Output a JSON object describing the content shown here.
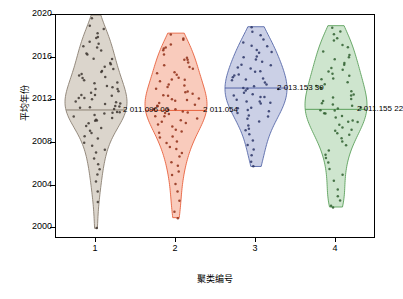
{
  "chart_data": {
    "type": "violin",
    "title": "",
    "xlabel": "聚类编号",
    "ylabel": "平均年份",
    "ylim": [
      1999,
      2020
    ],
    "xlim": [
      0.5,
      4.5
    ],
    "grid": false,
    "legend": "none",
    "y_ticks": [
      "2000",
      "2004",
      "2008",
      "2012",
      "2016",
      "2020"
    ],
    "y_tick_values": [
      2000,
      2004,
      2008,
      2012,
      2016,
      2020
    ],
    "x_ticks": [
      "1",
      "2",
      "3",
      "4"
    ],
    "x_tick_values": [
      1,
      2,
      3,
      4
    ],
    "categories": [
      "1",
      "2",
      "3",
      "4"
    ],
    "series": [
      {
        "name": "聚类1",
        "category": "1",
        "color": "#8a7f72",
        "fill": "#cfc7bb",
        "mean": 2011.09606,
        "mean_label": "2 011.096 06",
        "median": 2011.1,
        "min": 2000.0,
        "max": 2020.0,
        "n": 78,
        "points": [
          2019.6,
          2019.1,
          2018.6,
          2018.3,
          2018.0,
          2017.8,
          2017.5,
          2017.3,
          2017.0,
          2016.9,
          2016.6,
          2016.4,
          2016.2,
          2016.0,
          2015.8,
          2015.6,
          2015.4,
          2015.2,
          2015.0,
          2014.8,
          2014.6,
          2014.5,
          2014.3,
          2014.1,
          2014.0,
          2013.9,
          2013.7,
          2013.6,
          2013.4,
          2013.3,
          2013.1,
          2013.0,
          2012.9,
          2012.8,
          2012.6,
          2012.5,
          2012.4,
          2012.3,
          2012.2,
          2012.0,
          2011.9,
          2011.8,
          2011.7,
          2011.6,
          2011.5,
          2011.4,
          2011.3,
          2011.2,
          2011.1,
          2011.0,
          2010.9,
          2010.8,
          2010.7,
          2010.6,
          2010.5,
          2010.4,
          2010.2,
          2010.1,
          2010.0,
          2009.8,
          2009.6,
          2009.4,
          2009.2,
          2009.0,
          2008.7,
          2008.4,
          2008.1,
          2007.8,
          2007.4,
          2007.0,
          2006.6,
          2006.1,
          2005.6,
          2005.0,
          2004.3,
          2003.5,
          2002.4,
          2000.1
        ]
      },
      {
        "name": "聚类2",
        "category": "2",
        "color": "#e8603c",
        "fill": "#f7b9a6",
        "mean": 2011.054,
        "mean_label": "2 011.054",
        "median": 2011.05,
        "min": 2001.0,
        "max": 2018.3,
        "n": 74,
        "points": [
          2018.2,
          2017.9,
          2017.6,
          2017.3,
          2017.0,
          2016.8,
          2016.6,
          2016.3,
          2016.1,
          2015.9,
          2015.7,
          2015.5,
          2015.3,
          2015.1,
          2014.9,
          2014.7,
          2014.6,
          2014.4,
          2014.2,
          2014.0,
          2013.9,
          2013.7,
          2013.5,
          2013.4,
          2013.2,
          2013.1,
          2012.9,
          2012.8,
          2012.6,
          2012.5,
          2012.4,
          2012.2,
          2012.1,
          2012.0,
          2011.9,
          2011.8,
          2011.6,
          2011.5,
          2011.4,
          2011.3,
          2011.2,
          2011.1,
          2011.0,
          2010.9,
          2010.8,
          2010.7,
          2010.5,
          2010.4,
          2010.3,
          2010.1,
          2010.0,
          2009.8,
          2009.7,
          2009.5,
          2009.3,
          2009.1,
          2008.9,
          2008.7,
          2008.5,
          2008.2,
          2008.0,
          2007.7,
          2007.4,
          2007.1,
          2006.7,
          2006.3,
          2005.9,
          2005.4,
          2004.9,
          2004.2,
          2003.4,
          2002.6,
          2001.6,
          2001.0
        ]
      },
      {
        "name": "聚类3",
        "category": "3",
        "color": "#5566a8",
        "fill": "#b9c0de",
        "mean": 2013.15339,
        "mean_label": "2 013.153 39",
        "median": 2013.15,
        "min": 2005.8,
        "max": 2018.9,
        "n": 62,
        "points": [
          2018.8,
          2018.4,
          2018.1,
          2017.8,
          2017.5,
          2017.2,
          2017.0,
          2016.8,
          2016.6,
          2016.4,
          2016.2,
          2016.0,
          2015.8,
          2015.6,
          2015.4,
          2015.3,
          2015.1,
          2014.9,
          2014.8,
          2014.6,
          2014.5,
          2014.3,
          2014.2,
          2014.0,
          2013.9,
          2013.8,
          2013.6,
          2013.5,
          2013.4,
          2013.2,
          2013.1,
          2013.0,
          2012.9,
          2012.8,
          2012.6,
          2012.5,
          2012.4,
          2012.3,
          2012.1,
          2012.0,
          2011.9,
          2011.7,
          2011.6,
          2011.4,
          2011.3,
          2011.1,
          2011.0,
          2010.8,
          2010.6,
          2010.4,
          2010.2,
          2010.0,
          2009.7,
          2009.4,
          2009.1,
          2008.7,
          2008.3,
          2007.8,
          2007.3,
          2006.8,
          2006.3,
          2005.8
        ]
      },
      {
        "name": "聚类4",
        "category": "4",
        "color": "#5ba05b",
        "fill": "#bedcbe",
        "mean": 2011.15522,
        "mean_label": "2 011.155 22",
        "median": 2011.15,
        "min": 2002.0,
        "max": 2019.0,
        "n": 66,
        "points": [
          2018.9,
          2018.5,
          2018.1,
          2017.8,
          2017.5,
          2017.2,
          2016.9,
          2016.6,
          2016.3,
          2016.1,
          2015.8,
          2015.6,
          2015.4,
          2015.1,
          2014.9,
          2014.7,
          2014.5,
          2014.3,
          2014.1,
          2013.9,
          2013.7,
          2013.5,
          2013.3,
          2013.1,
          2013.0,
          2012.8,
          2012.6,
          2012.5,
          2012.3,
          2012.1,
          2012.0,
          2011.8,
          2011.7,
          2011.5,
          2011.4,
          2011.2,
          2011.1,
          2011.0,
          2010.8,
          2010.7,
          2010.5,
          2010.4,
          2010.2,
          2010.1,
          2009.9,
          2009.7,
          2009.5,
          2009.3,
          2009.1,
          2008.9,
          2008.7,
          2008.4,
          2008.1,
          2007.8,
          2007.4,
          2007.0,
          2006.6,
          2006.1,
          2005.6,
          2005.0,
          2004.4,
          2003.7,
          2003.0,
          2002.5,
          2002.2,
          2002.0
        ]
      }
    ],
    "annotations": [
      {
        "text": "2 011.096 06",
        "category": "1",
        "value": 2011.09606
      },
      {
        "text": "2 011.054",
        "category": "2",
        "value": 2011.054
      },
      {
        "text": "2 013.153 39",
        "category": "3",
        "value": 2013.15339
      },
      {
        "text": "2 011.155 22",
        "category": "4",
        "value": 2011.15522
      }
    ]
  }
}
